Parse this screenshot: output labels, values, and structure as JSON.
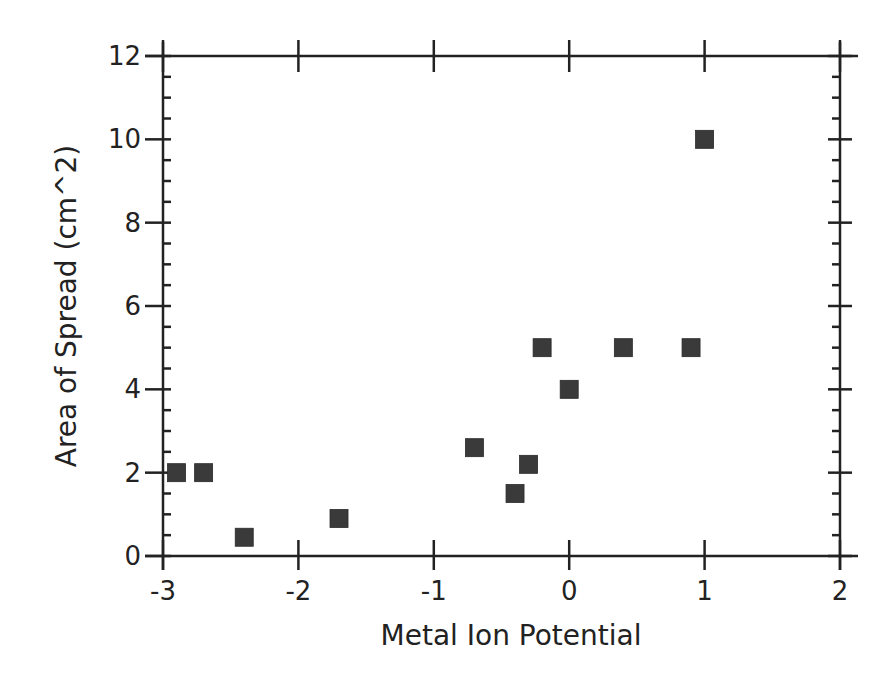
{
  "chart_data": {
    "type": "scatter",
    "title": "",
    "xlabel": "Metal Ion Potential",
    "ylabel": "Area of Spread (cm^2)",
    "xlim": [
      -3,
      2
    ],
    "ylim": [
      0,
      12
    ],
    "x_ticks": [
      -3,
      -2,
      -1,
      0,
      1,
      2
    ],
    "x_tick_labels": [
      "-3",
      "-2",
      "-1",
      "0",
      "1",
      "2"
    ],
    "y_ticks": [
      0,
      2,
      4,
      6,
      8,
      10,
      12
    ],
    "y_tick_labels": [
      "0",
      "2",
      "4",
      "6",
      "8",
      "10",
      "12"
    ],
    "y_minor_per_major": 3,
    "grid": false,
    "legend": null,
    "marker": "square",
    "marker_color": "#3a3a3a",
    "series": [
      {
        "name": "data",
        "points": [
          {
            "x": -2.9,
            "y": 2.0
          },
          {
            "x": -2.7,
            "y": 2.0
          },
          {
            "x": -2.4,
            "y": 0.45
          },
          {
            "x": -1.7,
            "y": 0.9
          },
          {
            "x": -0.7,
            "y": 2.6
          },
          {
            "x": -0.4,
            "y": 1.5
          },
          {
            "x": -0.3,
            "y": 2.2
          },
          {
            "x": -0.2,
            "y": 5.0
          },
          {
            "x": 0.0,
            "y": 4.0
          },
          {
            "x": 0.4,
            "y": 5.0
          },
          {
            "x": 0.9,
            "y": 5.0
          },
          {
            "x": 1.0,
            "y": 10.0
          }
        ]
      }
    ]
  }
}
